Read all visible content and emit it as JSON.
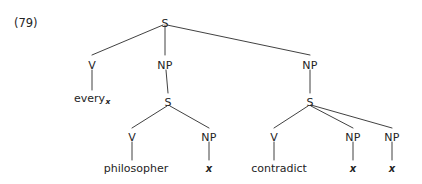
{
  "figure": {
    "example_number": "(79)",
    "caption": "",
    "ink_color": "#242424",
    "background_color": "#ffffff"
  },
  "tree": {
    "root": {
      "label": "S",
      "x": 165,
      "y": 18
    },
    "nodes": [
      {
        "id": "s-root",
        "label": "S",
        "x": 165,
        "y": 18,
        "kind": "nonterminal"
      },
      {
        "id": "v-every",
        "label": "V",
        "x": 92,
        "y": 60,
        "kind": "nonterminal"
      },
      {
        "id": "np-mid",
        "label": "NP",
        "x": 165,
        "y": 60,
        "kind": "nonterminal"
      },
      {
        "id": "np-right",
        "label": "NP",
        "x": 310,
        "y": 60,
        "kind": "nonterminal"
      },
      {
        "id": "s-mid",
        "label": "S",
        "x": 168,
        "y": 97,
        "kind": "nonterminal"
      },
      {
        "id": "s-right",
        "label": "S",
        "x": 310,
        "y": 97,
        "kind": "nonterminal"
      },
      {
        "id": "v-philosopher",
        "label": "V",
        "x": 132,
        "y": 132,
        "kind": "nonterminal"
      },
      {
        "id": "np-x-mid",
        "label": "NP",
        "x": 209,
        "y": 132,
        "kind": "nonterminal"
      },
      {
        "id": "v-contradict",
        "label": "V",
        "x": 274,
        "y": 132,
        "kind": "nonterminal"
      },
      {
        "id": "np-x-r1",
        "label": "NP",
        "x": 353,
        "y": 132,
        "kind": "nonterminal"
      },
      {
        "id": "np-x-r2",
        "label": "NP",
        "x": 392,
        "y": 132,
        "kind": "nonterminal"
      }
    ],
    "leaves": [
      {
        "id": "leaf-every",
        "text": "every",
        "subscript": "x",
        "x": 92,
        "y": 93,
        "italic": false
      },
      {
        "id": "leaf-philosopher",
        "text": "philosopher",
        "subscript": "",
        "x": 136,
        "y": 163,
        "italic": false
      },
      {
        "id": "leaf-x-mid",
        "text": "x",
        "subscript": "",
        "x": 209,
        "y": 163,
        "italic": true
      },
      {
        "id": "leaf-contradict",
        "text": "contradict",
        "subscript": "",
        "x": 279,
        "y": 163,
        "italic": false
      },
      {
        "id": "leaf-x-r1",
        "text": "x",
        "subscript": "",
        "x": 353,
        "y": 163,
        "italic": true
      },
      {
        "id": "leaf-x-r2",
        "text": "x",
        "subscript": "",
        "x": 392,
        "y": 163,
        "italic": true
      }
    ],
    "edges": [
      {
        "from": "s-root",
        "to": "v-every",
        "x1": 163,
        "y1": 25,
        "x2": 92,
        "y2": 55
      },
      {
        "from": "s-root",
        "to": "np-mid",
        "x1": 165,
        "y1": 25,
        "x2": 165,
        "y2": 55
      },
      {
        "from": "s-root",
        "to": "np-right",
        "x1": 167,
        "y1": 25,
        "x2": 310,
        "y2": 55
      },
      {
        "from": "v-every",
        "to": "leaf-every",
        "x1": 92,
        "y1": 70,
        "x2": 92,
        "y2": 90
      },
      {
        "from": "np-mid",
        "to": "s-mid",
        "x1": 166,
        "y1": 70,
        "x2": 168,
        "y2": 93
      },
      {
        "from": "np-right",
        "to": "s-right",
        "x1": 310,
        "y1": 70,
        "x2": 310,
        "y2": 93
      },
      {
        "from": "s-mid",
        "to": "v-philosopher",
        "x1": 167,
        "y1": 106,
        "x2": 132,
        "y2": 128
      },
      {
        "from": "s-mid",
        "to": "np-x-mid",
        "x1": 170,
        "y1": 106,
        "x2": 209,
        "y2": 128
      },
      {
        "from": "s-right",
        "to": "v-contradict",
        "x1": 308,
        "y1": 106,
        "x2": 274,
        "y2": 128
      },
      {
        "from": "s-right",
        "to": "np-x-r1",
        "x1": 311,
        "y1": 106,
        "x2": 353,
        "y2": 128
      },
      {
        "from": "s-right",
        "to": "np-x-r2",
        "x1": 311,
        "y1": 105,
        "x2": 392,
        "y2": 128
      },
      {
        "from": "v-philosopher",
        "to": "leaf-philosopher",
        "x1": 132,
        "y1": 142,
        "x2": 132,
        "y2": 160
      },
      {
        "from": "np-x-mid",
        "to": "leaf-x-mid",
        "x1": 209,
        "y1": 142,
        "x2": 209,
        "y2": 160
      },
      {
        "from": "v-contradict",
        "to": "leaf-contradict",
        "x1": 274,
        "y1": 142,
        "x2": 274,
        "y2": 160
      },
      {
        "from": "np-x-r1",
        "to": "leaf-x-r1",
        "x1": 353,
        "y1": 142,
        "x2": 353,
        "y2": 160
      },
      {
        "from": "np-x-r2",
        "to": "leaf-x-r2",
        "x1": 392,
        "y1": 142,
        "x2": 392,
        "y2": 160
      }
    ]
  }
}
